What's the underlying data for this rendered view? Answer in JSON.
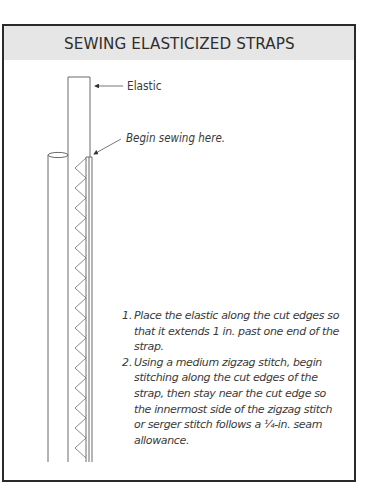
{
  "figure": {
    "title": "SEWING ELASTICIZED STRAPS",
    "colors": {
      "frame_border": "#2a2a2a",
      "title_band": "#e6e6e6",
      "line_art": "#555555",
      "text": "#3a3a3a"
    }
  },
  "illustration": {
    "callouts": [
      {
        "id": "elastic",
        "label": "Elastic"
      },
      {
        "id": "begin-sewing",
        "label": "Begin sewing here."
      }
    ],
    "parts": [
      "strap",
      "elastic",
      "zigzag-stitch"
    ]
  },
  "instructions": [
    {
      "number": "1.",
      "text": "Place the elastic along the cut edges so that it extends 1 in. past one end of the strap."
    },
    {
      "number": "2.",
      "text": "Using a medium zigzag stitch, begin stitching along the cut edges of the strap, then stay near the cut edge so the innermost side of the zigzag stitch or serger stitch follows a ¼-in. seam allowance."
    }
  ]
}
